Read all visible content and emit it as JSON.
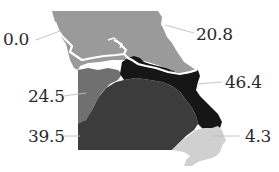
{
  "map": {
    "subject": "Missouri regions",
    "regions": [
      {
        "id": "north",
        "value": "0.0",
        "color": "#9a9a9a"
      },
      {
        "id": "northeast",
        "value": "20.8",
        "color": "#9a9a9a"
      },
      {
        "id": "east-band",
        "value": "46.4",
        "color": "#161616"
      },
      {
        "id": "west-central",
        "value": "24.5",
        "color": "#707070"
      },
      {
        "id": "south",
        "value": "39.5",
        "color": "#3c3c3c"
      },
      {
        "id": "bootheel",
        "value": "4.3",
        "color": "#d0d0d0"
      }
    ],
    "labels": {
      "north_west": "0.0",
      "north_east": "20.8",
      "east": "46.4",
      "west_central": "24.5",
      "south_west": "39.5",
      "south_east": "4.3"
    },
    "colors": {
      "river": "#ffffff",
      "leader_line": "#bdbdbd",
      "text": "#2a2a2a",
      "background": "#ffffff"
    }
  }
}
